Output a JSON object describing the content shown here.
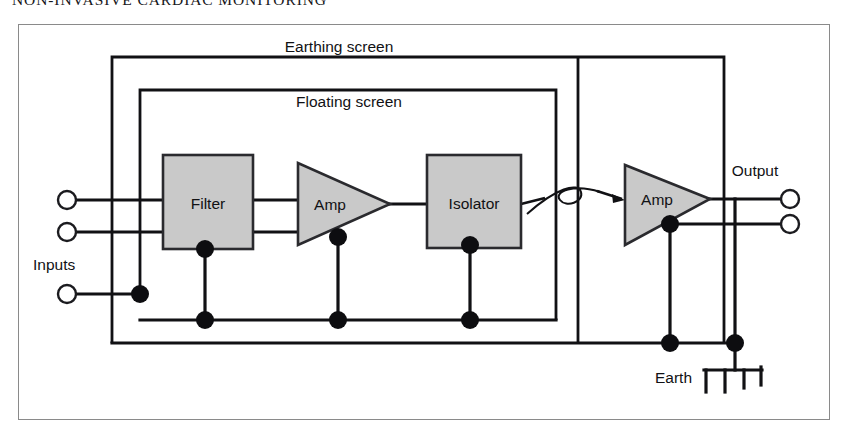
{
  "page": {
    "running_head": "NON-INVASIVE CARDIAC MONITORING"
  },
  "figure": {
    "type": "block-diagram",
    "background": "#ffffff",
    "frame_color": "#8a8a8a",
    "block_fill": "#c9c9c9",
    "line_color": "#111114",
    "screens": [
      {
        "id": "earthing-screen",
        "label": "Earthing screen"
      },
      {
        "id": "floating-screen",
        "label": "Floating screen"
      }
    ],
    "blocks": [
      {
        "id": "filter",
        "label": "Filter",
        "shape": "rect"
      },
      {
        "id": "amp1",
        "label": "Amp",
        "shape": "triangle"
      },
      {
        "id": "isolator",
        "label": "Isolator",
        "shape": "rect"
      },
      {
        "id": "amp2",
        "label": "Amp",
        "shape": "triangle"
      }
    ],
    "ports": [
      {
        "id": "inputs",
        "label": "Inputs",
        "count": 3
      },
      {
        "id": "output",
        "label": "Output",
        "count": 2
      },
      {
        "id": "earth",
        "label": "Earth",
        "count": 1
      }
    ],
    "labels": {
      "earthing_screen": "Earthing screen",
      "floating_screen": "Floating screen",
      "filter": "Filter",
      "amp_left": "Amp",
      "isolator": "Isolator",
      "amp_right": "Amp",
      "inputs": "Inputs",
      "output": "Output",
      "earth": "Earth"
    }
  }
}
